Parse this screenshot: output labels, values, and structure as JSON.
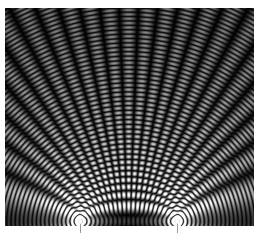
{
  "figure": {
    "title": "",
    "background_color": "#ffffff",
    "width": 261,
    "height": 236
  },
  "plot_area": {
    "x": 5,
    "y": 8,
    "width": 249,
    "height": 218,
    "background_color": "#000000",
    "border_color": "#000000"
  },
  "axes": {
    "xlabel": "",
    "ylabel": "",
    "xticklabels": [],
    "yticklabels": [],
    "grid": false,
    "frame_visible": false
  },
  "ticks": {
    "tick_color": "#9a9a9a",
    "tick_length": 9,
    "positions_px": [
      80,
      177
    ]
  },
  "chart_data": {
    "type": "heatmap",
    "title": "",
    "subtitle": "",
    "xlabel": "",
    "ylabel": "",
    "grid": false,
    "legend": "none",
    "colormap": "gray",
    "colormap_stops": [
      "#000000",
      "#ffffff"
    ],
    "value_label": "wave amplitude (intensity)",
    "vmin": 0,
    "vmax": 1,
    "xlim": [
      0,
      249
    ],
    "ylim": [
      0,
      218
    ],
    "xticklabels": [],
    "yticklabels": [],
    "model": "intensity = |cos(k*r1 - w*t) / sqrt(r1) + cos(k*r2 - w*t) / sqrt(r2)|",
    "sources": [
      {
        "name": "source-left",
        "x": 75,
        "y": 213,
        "phase": 0,
        "amplitude": 1
      },
      {
        "name": "source-right",
        "x": 172,
        "y": 213,
        "phase": 0,
        "amplitude": 1
      }
    ],
    "source_separation_px": 97,
    "wavelength_px": 8.5,
    "wavenumber": 0.7392,
    "num_visible_fringes_vertical": 25,
    "num_nodal_lines": 22,
    "central_maximum_x_px": 123.5,
    "amplitude_falloff": "1/sqrt(r)",
    "gamma": 0.85,
    "brightness_gain": 1.35,
    "noise_amplitude": 0.018
  },
  "annotations": {
    "source_dot_color": "#ffffff",
    "source_dot_radius_px": 2
  }
}
